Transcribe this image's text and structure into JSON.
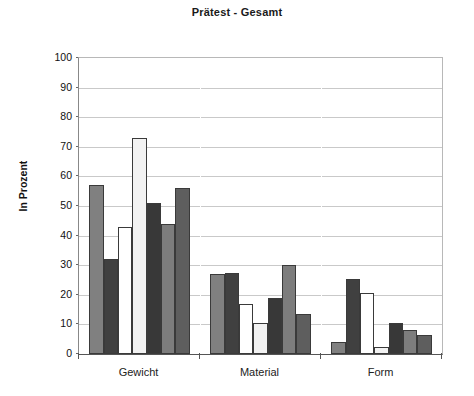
{
  "chart_data": {
    "type": "bar",
    "title": "Prätest - Gesamt",
    "xlabel": "",
    "ylabel": "In Prozent",
    "ylim": [
      0,
      100
    ],
    "ytick_labels": [
      "100",
      "90",
      "80",
      "70",
      "60",
      "50",
      "40",
      "30",
      "20",
      "10",
      "0"
    ],
    "ytick_values": [
      100,
      90,
      80,
      70,
      60,
      50,
      40,
      30,
      20,
      10,
      0
    ],
    "grid": true,
    "legend": "none",
    "categories": [
      "Gewicht",
      "Material",
      "Form"
    ],
    "series": [
      {
        "name": "Serie 1",
        "color": "#808080",
        "values": [
          57,
          27,
          4
        ]
      },
      {
        "name": "Serie 2",
        "color": "#404040",
        "values": [
          32,
          27.5,
          25.5
        ]
      },
      {
        "name": "Serie 3",
        "color": "#ffffff",
        "values": [
          43,
          17,
          20.5
        ]
      },
      {
        "name": "Serie 4",
        "color": "#f2f2f2",
        "values": [
          73,
          10.5,
          2.5
        ]
      },
      {
        "name": "Serie 5",
        "color": "#383838",
        "values": [
          51,
          19,
          10.5
        ]
      },
      {
        "name": "Serie 6",
        "color": "#7d7d7d",
        "values": [
          44,
          30,
          8
        ]
      },
      {
        "name": "Serie 7",
        "color": "#5e5e5e",
        "values": [
          56,
          13.5,
          6.5
        ]
      }
    ]
  },
  "colors": {
    "axis": "#555555",
    "grid": "#c9c9c9",
    "bar_outline": "#3a3a3a",
    "text": "#111111",
    "background": "#ffffff"
  }
}
